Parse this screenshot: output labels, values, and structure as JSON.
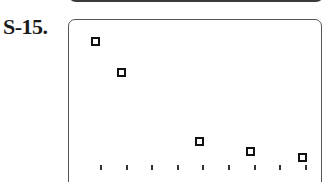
{
  "problem_label": "S-15.",
  "chart_data": {
    "type": "scatter",
    "title": "",
    "xlabel": "",
    "ylabel": "",
    "grid": false,
    "marker": "open-square",
    "x_ticks_count": 9,
    "points_px": [
      {
        "x": 95,
        "y": 41
      },
      {
        "x": 121,
        "y": 72
      },
      {
        "x": 199,
        "y": 141
      },
      {
        "x": 250,
        "y": 151
      },
      {
        "x": 302,
        "y": 157
      }
    ],
    "points_tick_units": [
      {
        "x": 0.85,
        "y": 8.3
      },
      {
        "x": 1.85,
        "y": 6.6
      },
      {
        "x": 4.85,
        "y": 2.9
      },
      {
        "x": 6.85,
        "y": 2.3
      },
      {
        "x": 8.85,
        "y": 2.0
      }
    ],
    "tick_x_px": [
      101,
      127,
      152,
      178,
      203,
      229,
      255,
      280,
      306
    ]
  }
}
